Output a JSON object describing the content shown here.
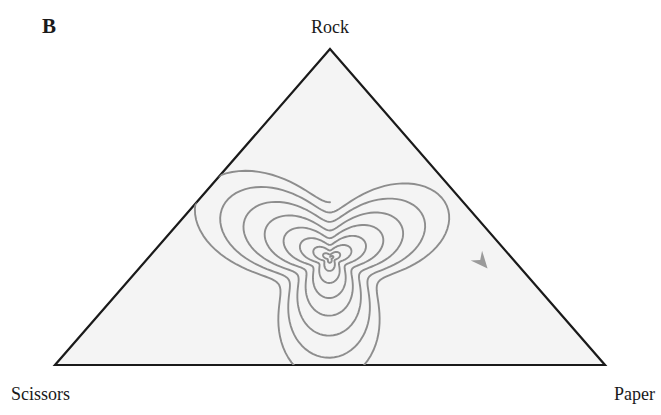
{
  "figure": {
    "panel_letter": "B",
    "width": 661,
    "height": 415,
    "background_color": "#ffffff"
  },
  "vertex_labels": {
    "top": "Rock",
    "bottom_left": "Scissors",
    "bottom_right": "Paper"
  },
  "colors": {
    "triangle_stroke": "#1a1a1a",
    "triangle_fill": "#f4f4f4",
    "spiral_stroke": "#8d8d8d",
    "arrow_fill": "#9a9a9a",
    "text": "#1a1a1a"
  },
  "chart_data": {
    "type": "line",
    "title": "B",
    "xlabel": "",
    "ylabel": "",
    "grid": false,
    "legend_position": "none",
    "simplex": {
      "shape": "equilateral-triangle",
      "vertices": [
        {
          "name": "Rock",
          "x": 330,
          "y": 49
        },
        {
          "name": "Paper",
          "x": 605,
          "y": 365
        },
        {
          "name": "Scissors",
          "x": 55,
          "y": 365
        }
      ],
      "fixed_point": {
        "x": 330,
        "y": 258,
        "label": "interior equilibrium (1/3, 1/3, 1/3)"
      }
    },
    "annotations": [
      {
        "type": "arrowhead",
        "label": "flow-direction",
        "x": 482,
        "y": 262,
        "direction": "down-right",
        "angle_deg": 49,
        "meaning": "Rock to Paper to Scissors cycling, outward spiral"
      }
    ],
    "series": [
      {
        "name": "outward-spiral-trajectory",
        "description": "Rounded-triangular orbit spiralling outward from the interior fixed point toward the simplex boundary",
        "turns": 8,
        "center": [
          330,
          258
        ],
        "start_radius": 3,
        "end_radius": 140,
        "rotation": "clockwise",
        "corner_rounding": 0.42,
        "points_per_turn": 160
      }
    ],
    "xlim": [
      0,
      661
    ],
    "ylim": [
      0,
      415
    ]
  }
}
